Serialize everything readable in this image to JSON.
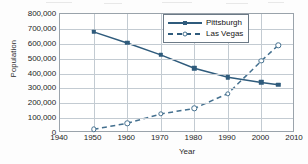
{
  "chart_data": {
    "type": "line",
    "title": "",
    "xlabel": "Year",
    "ylabel": "Population",
    "xlim": [
      1940,
      2010
    ],
    "ylim": [
      0,
      800000
    ],
    "grid": true,
    "legend_position": "top-right",
    "xticks": [
      1940,
      1950,
      1960,
      1970,
      1980,
      1990,
      2000,
      2010
    ],
    "xtick_labels": [
      "1940",
      "1950",
      "1960",
      "1970",
      "1980",
      "1990",
      "2000",
      "2010"
    ],
    "yticks": [
      0,
      100000,
      200000,
      300000,
      400000,
      500000,
      600000,
      700000,
      800000
    ],
    "ytick_labels": [
      "0",
      "100,000",
      "200,000",
      "300,000",
      "400,000",
      "500,000",
      "600,000",
      "700,000",
      "800,000"
    ],
    "series": [
      {
        "name": "Pittsburgh",
        "color": "#2f5b7c",
        "linestyle": "solid",
        "marker": "filled-square",
        "x": [
          1950,
          1960,
          1970,
          1980,
          1990,
          2000,
          2005
        ],
        "values": [
          680000,
          605000,
          525000,
          435000,
          375000,
          340000,
          325000
        ]
      },
      {
        "name": "Las Vegas",
        "color": "#44708f",
        "linestyle": "dashed",
        "marker": "open-circle",
        "x": [
          1950,
          1960,
          1970,
          1980,
          1990,
          2000,
          2005
        ],
        "values": [
          25000,
          65000,
          128000,
          165000,
          265000,
          485000,
          590000
        ]
      }
    ],
    "annotations": []
  },
  "legend": {
    "entries": [
      {
        "label": "Pittsburgh"
      },
      {
        "label": "Las Vegas"
      }
    ]
  }
}
